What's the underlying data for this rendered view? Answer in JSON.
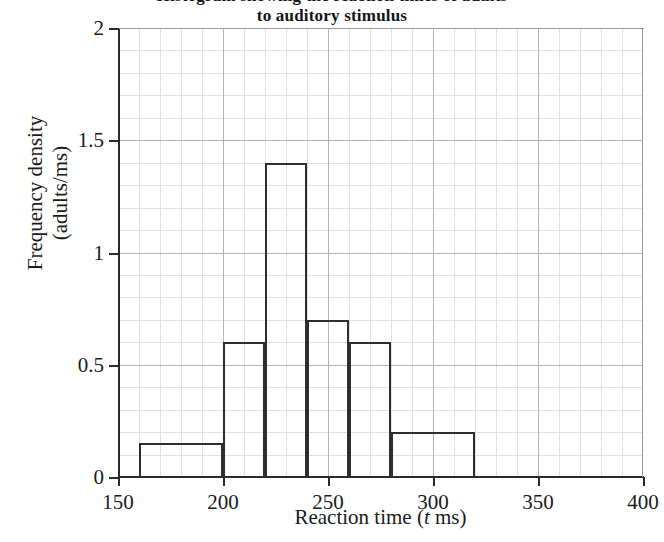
{
  "chart_data": {
    "type": "bar",
    "title": "Histogram showing the reaction times of adults\nto auditory stimulus",
    "title_visible_text": "to auditory stimulus",
    "xlabel": "Reaction time (t ms)",
    "xlabel_prefix": "Reaction time (",
    "xlabel_italic": "t",
    "xlabel_suffix": " ms)",
    "ylabel": "Frequency density\n(adults/ms)",
    "ylabel_line1": "Frequency density",
    "ylabel_line2": "(adults/ms)",
    "xlim": [
      150,
      400
    ],
    "ylim": [
      0,
      2
    ],
    "grid": true,
    "grid_major_x_step": 50,
    "grid_minor_x_step": 10,
    "grid_major_y_step": 0.5,
    "grid_minor_y_step": 0.1,
    "legend": "none",
    "xticks": [
      150,
      200,
      250,
      300,
      350,
      400
    ],
    "xtick_labels": [
      "150",
      "200",
      "250",
      "300",
      "350",
      "400"
    ],
    "yticks": [
      0,
      0.5,
      1,
      1.5,
      2
    ],
    "ytick_labels": [
      "0",
      "0.5",
      "1",
      "1.5",
      "2"
    ],
    "bins": [
      {
        "start": 160,
        "end": 200,
        "value": 0.15,
        "label": "160-200"
      },
      {
        "start": 200,
        "end": 220,
        "value": 0.6,
        "label": "200-220"
      },
      {
        "start": 220,
        "end": 240,
        "value": 1.4,
        "label": "220-240"
      },
      {
        "start": 240,
        "end": 260,
        "value": 0.7,
        "label": "240-260"
      },
      {
        "start": 260,
        "end": 280,
        "value": 0.6,
        "label": "260-280"
      },
      {
        "start": 280,
        "end": 320,
        "value": 0.2,
        "label": "280-320"
      }
    ],
    "colors": {
      "bar_outline": "#2e2e2e",
      "bar_fill": "none",
      "axis": "#2b2b2b",
      "grid_major": "#b4b4b4",
      "grid_minor": "#e2e2e2",
      "text": "#1a1a1a",
      "background": "#ffffff"
    }
  }
}
